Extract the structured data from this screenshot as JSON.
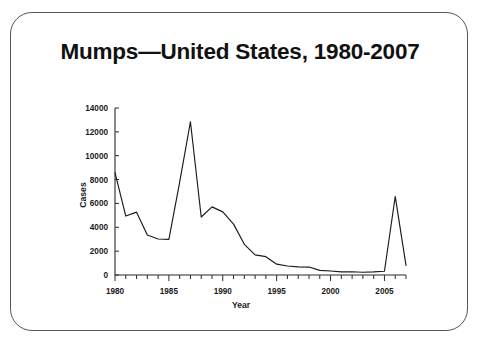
{
  "slide": {
    "title": "Mumps—United States, 1980-2007",
    "border_color": "#555555",
    "background": "#ffffff"
  },
  "chart_data": {
    "type": "line",
    "title": "Mumps—United States, 1980-2007",
    "xlabel": "Year",
    "ylabel": "Cases",
    "xlim": [
      1980,
      2007
    ],
    "ylim": [
      0,
      14000
    ],
    "yticks": [
      0,
      2000,
      4000,
      6000,
      8000,
      10000,
      12000,
      14000
    ],
    "ytick_labels": [
      "0",
      "2000",
      "4000",
      "6000",
      "8000",
      "10000",
      "12000",
      "14000"
    ],
    "xticks": [
      1980,
      1985,
      1990,
      1995,
      2000,
      2005
    ],
    "xtick_labels": [
      "1980",
      "1985",
      "1990",
      "1995",
      "2000",
      "2005"
    ],
    "x_minor_tick_interval": 1,
    "grid": false,
    "legend": null,
    "line_color": "#1a1a1a",
    "x": [
      1980,
      1981,
      1982,
      1983,
      1984,
      1985,
      1986,
      1987,
      1988,
      1989,
      1990,
      1991,
      1992,
      1993,
      1994,
      1995,
      1996,
      1997,
      1998,
      1999,
      2000,
      2001,
      2002,
      2003,
      2004,
      2005,
      2006,
      2007
    ],
    "values": [
      8576,
      4941,
      5270,
      3355,
      3021,
      2982,
      7790,
      12848,
      4866,
      5712,
      5292,
      4264,
      2572,
      1692,
      1537,
      906,
      751,
      683,
      666,
      387,
      338,
      266,
      270,
      231,
      258,
      314,
      6584,
      800
    ],
    "categories": [
      "1980",
      "1981",
      "1982",
      "1983",
      "1984",
      "1985",
      "1986",
      "1987",
      "1988",
      "1989",
      "1990",
      "1991",
      "1992",
      "1993",
      "1994",
      "1995",
      "1996",
      "1997",
      "1998",
      "1999",
      "2000",
      "2001",
      "2002",
      "2003",
      "2004",
      "2005",
      "2006",
      "2007"
    ],
    "annotations": []
  }
}
